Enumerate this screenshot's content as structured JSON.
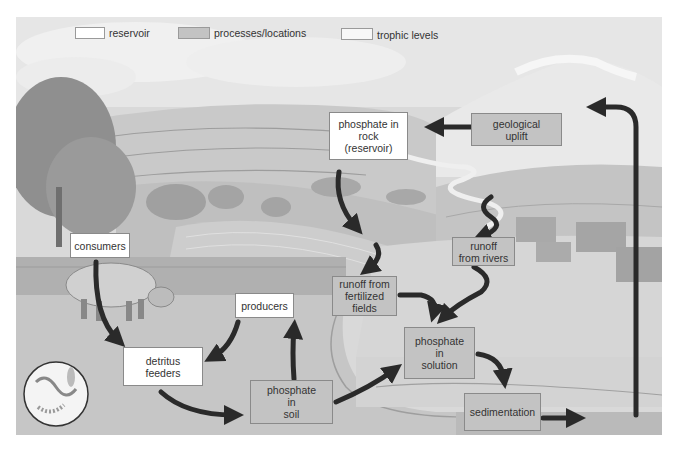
{
  "legend": {
    "items": [
      {
        "label": "reservoir",
        "swatch_color": "#ffffff"
      },
      {
        "label": "processes/locations",
        "swatch_color": "#c3c3c3"
      },
      {
        "label": "trophic levels",
        "swatch_color": "#f7f7f7"
      }
    ]
  },
  "nodes": {
    "phosphate_rock": {
      "type": "reservoir",
      "lines": [
        "phosphate in",
        "rock",
        "(reservoir)"
      ]
    },
    "geological_uplift": {
      "type": "process",
      "lines": [
        "geological",
        "uplift"
      ]
    },
    "runoff_rivers": {
      "type": "process",
      "lines": [
        "runoff",
        "from rivers"
      ]
    },
    "consumers": {
      "type": "trophic",
      "lines": [
        "consumers"
      ]
    },
    "producers": {
      "type": "trophic",
      "lines": [
        "producers"
      ]
    },
    "runoff_fields": {
      "type": "process",
      "lines": [
        "runoff from",
        "fertilized",
        "fields"
      ]
    },
    "detritus_feeders": {
      "type": "trophic",
      "lines": [
        "detritus",
        "feeders"
      ]
    },
    "phosphate_soil": {
      "type": "process",
      "lines": [
        "phosphate",
        "in",
        "soil"
      ]
    },
    "phosphate_solution": {
      "type": "process",
      "lines": [
        "phosphate",
        "in",
        "solution"
      ]
    },
    "sedimentation": {
      "type": "process",
      "lines": [
        "sedimentation"
      ]
    }
  },
  "edges": [
    {
      "from": "geological_uplift",
      "to": "phosphate_rock"
    },
    {
      "from": "sedimentation",
      "to": "geological_uplift"
    },
    {
      "from": "phosphate_rock",
      "to": "runoff_fields"
    },
    {
      "from": "runoff_rivers",
      "to": "phosphate_solution"
    },
    {
      "from": "runoff_fields",
      "to": "phosphate_solution"
    },
    {
      "from": "consumers",
      "to": "detritus_feeders"
    },
    {
      "from": "producers",
      "to": "detritus_feeders"
    },
    {
      "from": "detritus_feeders",
      "to": "phosphate_soil"
    },
    {
      "from": "phosphate_soil",
      "to": "producers"
    },
    {
      "from": "phosphate_soil",
      "to": "phosphate_solution"
    },
    {
      "from": "phosphate_solution",
      "to": "sedimentation"
    }
  ],
  "colors": {
    "arrow": "#2a2a2a",
    "process_fill": "#c3c3c3",
    "reservoir_fill": "#ffffff",
    "sky": "#e4e4e4",
    "ground": "#bdbdbd",
    "water": "#d8d8d8"
  }
}
